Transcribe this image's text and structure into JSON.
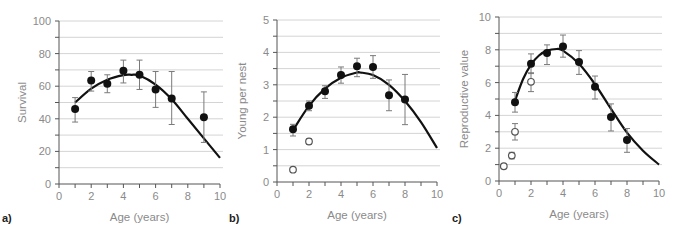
{
  "figure": {
    "panels": [
      {
        "letter": "a)",
        "xlabel": "Age (years)",
        "ylabel": "Survival"
      },
      {
        "letter": "b)",
        "xlabel": "Age (years)",
        "ylabel": "Young per nest"
      },
      {
        "letter": "c)",
        "xlabel": "Age (years)",
        "ylabel": "Reproductive value"
      }
    ]
  },
  "chart_data": [
    {
      "type": "scatter",
      "panel": "a)",
      "title": "",
      "xlabel": "Age (years)",
      "ylabel": "Survival",
      "xlim": [
        0,
        10
      ],
      "ylim": [
        0,
        100
      ],
      "xticks": [
        0,
        2,
        4,
        6,
        8,
        10
      ],
      "yticks": [
        0,
        20,
        40,
        60,
        80,
        100
      ],
      "grid": "horizontal every 10",
      "series": [
        {
          "name": "filled",
          "marker": "filled-circle",
          "x": [
            1,
            2,
            3,
            4,
            5,
            6,
            7,
            9
          ],
          "y": [
            46,
            63.5,
            61.5,
            69.5,
            67,
            58,
            52.5,
            41
          ],
          "err_low": [
            38,
            57,
            56,
            62,
            58,
            47,
            36.5,
            25.5
          ],
          "err_high": [
            53,
            69,
            67,
            76,
            76,
            69,
            69,
            56.5
          ]
        }
      ],
      "fit_curve": {
        "x": [
          1,
          2,
          3,
          4,
          4.5,
          5,
          6,
          7,
          8,
          9,
          10
        ],
        "y": [
          50,
          58.5,
          64,
          66.8,
          67,
          66.5,
          61,
          52,
          40,
          28,
          16
        ]
      }
    },
    {
      "type": "scatter",
      "panel": "b)",
      "title": "",
      "xlabel": "Age (years)",
      "ylabel": "Young per nest",
      "xlim": [
        0,
        10
      ],
      "ylim": [
        0,
        5
      ],
      "xticks": [
        0,
        2,
        4,
        6,
        8,
        10
      ],
      "yticks": [
        0,
        1,
        2,
        3,
        4,
        5
      ],
      "grid": "horizontal every 0.5",
      "series": [
        {
          "name": "filled",
          "marker": "filled-circle",
          "x": [
            1,
            2,
            3,
            4,
            5,
            6,
            7,
            8
          ],
          "y": [
            1.63,
            2.35,
            2.8,
            3.3,
            3.57,
            3.55,
            2.68,
            2.55
          ],
          "err_low": [
            1.42,
            2.2,
            2.58,
            3.05,
            3.25,
            3.2,
            2.2,
            1.77
          ],
          "err_high": [
            1.78,
            2.5,
            2.97,
            3.55,
            3.82,
            3.9,
            3.15,
            3.32
          ]
        },
        {
          "name": "open",
          "marker": "open-circle",
          "x": [
            1,
            2
          ],
          "y": [
            0.38,
            1.25
          ],
          "err_low": [
            0.32,
            1.17
          ],
          "err_high": [
            0.44,
            1.33
          ]
        }
      ],
      "fit_curve": {
        "x": [
          1,
          2,
          3,
          4,
          5,
          5.2,
          6,
          7,
          8,
          9,
          10
        ],
        "y": [
          1.6,
          2.35,
          2.88,
          3.22,
          3.38,
          3.38,
          3.3,
          3.0,
          2.5,
          1.85,
          1.05
        ]
      }
    },
    {
      "type": "scatter",
      "panel": "c)",
      "title": "",
      "xlabel": "Age (years)",
      "ylabel": "Reproductive value",
      "xlim": [
        0,
        10
      ],
      "ylim": [
        0,
        10
      ],
      "xticks": [
        0,
        2,
        4,
        6,
        8,
        10
      ],
      "yticks": [
        0,
        2,
        4,
        6,
        8,
        10
      ],
      "grid": "horizontal every 1",
      "series": [
        {
          "name": "filled",
          "marker": "filled-circle",
          "x": [
            1,
            2,
            3,
            4,
            5,
            6,
            7,
            8
          ],
          "y": [
            4.8,
            7.15,
            7.8,
            8.2,
            7.25,
            5.75,
            3.9,
            2.5
          ],
          "err_low": [
            4.2,
            6.55,
            7.1,
            7.55,
            6.5,
            5.0,
            3.05,
            1.75
          ],
          "err_high": [
            5.4,
            7.75,
            8.3,
            8.9,
            7.95,
            6.4,
            4.7,
            3.2
          ]
        },
        {
          "name": "open",
          "marker": "open-circle",
          "x": [
            0.3,
            0.8,
            1,
            2
          ],
          "y": [
            0.9,
            1.55,
            3.0,
            6.05
          ],
          "err_low": [
            0.8,
            1.35,
            2.5,
            5.45
          ],
          "err_high": [
            1.0,
            1.75,
            3.5,
            6.6
          ]
        }
      ],
      "fit_curve": {
        "x": [
          1,
          1.5,
          2,
          2.5,
          3,
          3.6,
          4,
          5,
          6,
          7,
          8,
          9,
          10
        ],
        "y": [
          4.9,
          6.2,
          7.1,
          7.65,
          7.95,
          8.05,
          7.95,
          7.15,
          5.9,
          4.4,
          2.95,
          1.85,
          1.0
        ]
      }
    }
  ]
}
